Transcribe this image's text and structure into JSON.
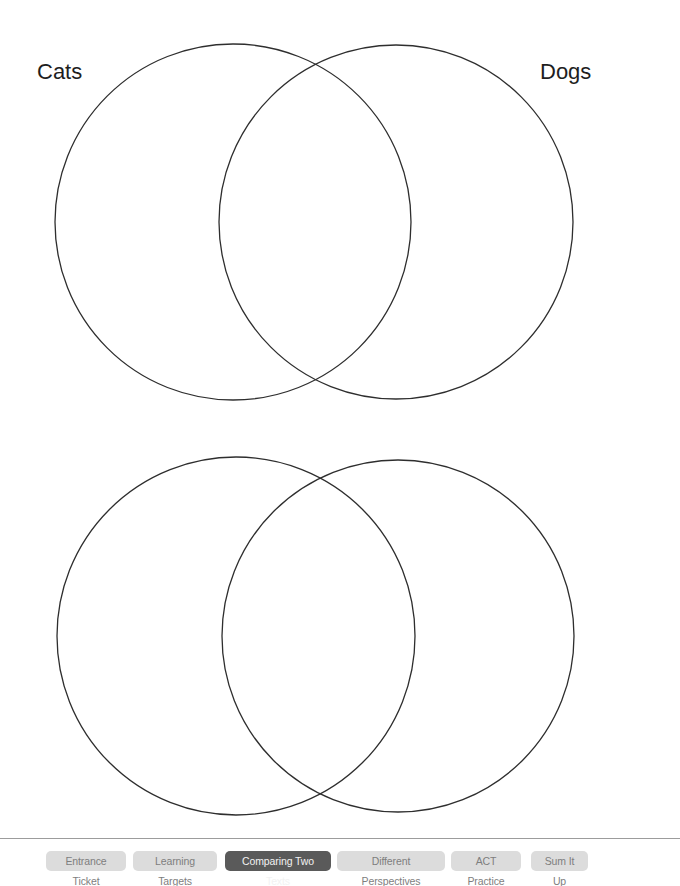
{
  "diagrams": [
    {
      "labels": {
        "left": "Cats",
        "right": "Dogs"
      },
      "circles": [
        {
          "cx": 233,
          "cy": 222,
          "r": 178
        },
        {
          "cx": 396,
          "cy": 222,
          "r": 177
        }
      ]
    },
    {
      "labels": {
        "left": "",
        "right": ""
      },
      "circles": [
        {
          "cx": 236,
          "cy": 636,
          "r": 179
        },
        {
          "cx": 398,
          "cy": 636,
          "r": 176
        }
      ]
    }
  ],
  "stroke_color": "#2e2e2e",
  "nav": {
    "items": [
      {
        "label": "Entrance Ticket",
        "active": false
      },
      {
        "label": "Learning Targets",
        "active": false
      },
      {
        "label": "Comparing Two Texts",
        "active": true
      },
      {
        "label": "Different Perspectives",
        "active": false
      },
      {
        "label": "ACT Practice",
        "active": false
      },
      {
        "label": "Sum It Up",
        "active": false
      }
    ],
    "colors": {
      "inactive_bg": "#dcdcdc",
      "inactive_text": "#7e7e7e",
      "active_bg": "#5a5a5a",
      "active_text": "#f2f2f2"
    }
  }
}
